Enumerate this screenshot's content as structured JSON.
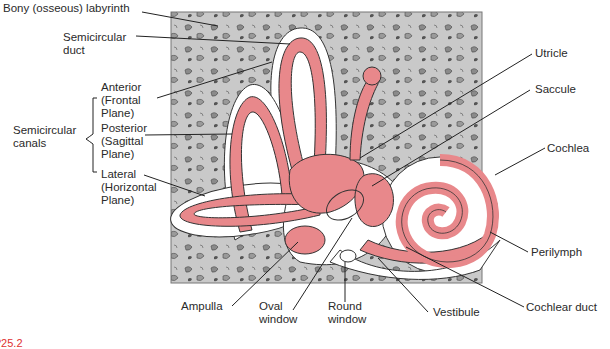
{
  "diagram": {
    "colors": {
      "bone": "#c9c9c9",
      "membrane": "#e8888b",
      "perilymph": "#ffffff",
      "outline": "#333333",
      "figure_label": "#e03030"
    },
    "labels": {
      "bony_labyrinth": "Bony (osseous) labyrinth",
      "semicircular_duct": "Semicircular\nduct",
      "anterior": "Anterior\n(Frontal\nPlane)",
      "semicircular_canals": "Semicircular\ncanals",
      "posterior": "Posterior\n(Sagittal\nPlane)",
      "lateral": "Lateral\n(Horizontal\nPlane)",
      "utricle": "Utricle",
      "saccule": "Saccule",
      "cochlea": "Cochlea",
      "perilymph": "Perilymph",
      "cochlear_duct": "Cochlear duct",
      "vestibule": "Vestibule",
      "round_window": "Round\nwindow",
      "oval_window": "Oval\nwindow",
      "ampulla": "Ampulla"
    },
    "figure_number": "?25.2"
  }
}
